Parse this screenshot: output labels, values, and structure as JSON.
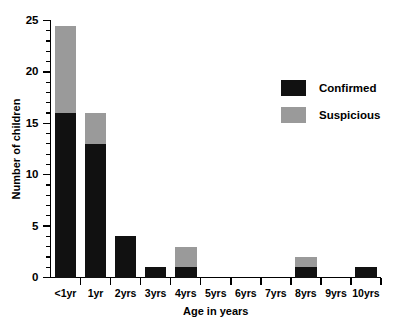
{
  "chart_data": {
    "type": "bar",
    "subtype": "stacked",
    "title": "",
    "xlabel": "Age in years",
    "ylabel": "Number of children",
    "categories": [
      "<1yr",
      "1yr",
      "2yrs",
      "3yrs",
      "4yrs",
      "5yrs",
      "6yrs",
      "7yrs",
      "8yrs",
      "9yrs",
      "10yrs"
    ],
    "series": [
      {
        "name": "Confirmed",
        "color": "#111111",
        "values": [
          16,
          13,
          4,
          1,
          1,
          0,
          0,
          0,
          1,
          0,
          1
        ]
      },
      {
        "name": "Suspicious",
        "color": "#9a9a9a",
        "values": [
          8.5,
          3,
          0,
          0,
          2,
          0,
          0,
          0,
          1,
          0,
          0
        ]
      }
    ],
    "totals": [
      24.5,
      16,
      4,
      1,
      3,
      0,
      0,
      0,
      2,
      0,
      1
    ],
    "ylim": [
      0,
      25
    ],
    "ytick_labels": [
      "0",
      "5",
      "10",
      "15",
      "20",
      "25"
    ],
    "ytick_values": [
      0,
      5,
      10,
      15,
      20,
      25
    ],
    "yminor_step": 1,
    "grid": false,
    "legend_position": "upper-right"
  },
  "legend": {
    "entries": [
      {
        "label": "Confirmed",
        "color": "#111111"
      },
      {
        "label": "Suspicious",
        "color": "#9a9a9a"
      }
    ]
  }
}
